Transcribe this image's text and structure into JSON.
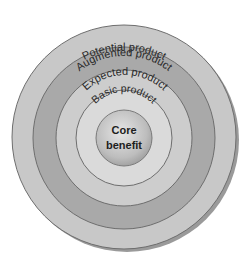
{
  "diagram": {
    "type": "concentric-levels",
    "colors": {
      "potential": "#c8c8c8",
      "augmented": "#a9a9a9",
      "expected": "#cdcdcd",
      "basic": "#dadada",
      "core": "#bdbdbd",
      "stroke": "#6e6e6e",
      "text": "#2a2a2a",
      "shadow": "#8a8a8a"
    },
    "rings": [
      {
        "id": "potential",
        "label": "Potential product"
      },
      {
        "id": "augmented",
        "label": "Augmented product"
      },
      {
        "id": "expected",
        "label": "Expected product"
      },
      {
        "id": "basic",
        "label": "Basic product"
      }
    ],
    "core": {
      "line1": "Core",
      "line2": "benefit"
    }
  }
}
